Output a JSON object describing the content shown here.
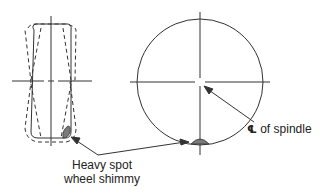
{
  "diagram": {
    "views": [
      {
        "name": "front-view",
        "description": "Tire viewed from front, dashed outline showing lateral wobble"
      },
      {
        "name": "side-view",
        "description": "Tire viewed from side, circle with centerline crosshair"
      }
    ],
    "labels": {
      "spindle_symbol": "℄",
      "spindle_text": " of spindle",
      "heavy_line1": "Heavy spot",
      "heavy_line2": "wheel shimmy"
    },
    "colors": {
      "line": "#333333",
      "heavy_spot_fill": "#7a7a7a",
      "background": "#ffffff"
    }
  }
}
